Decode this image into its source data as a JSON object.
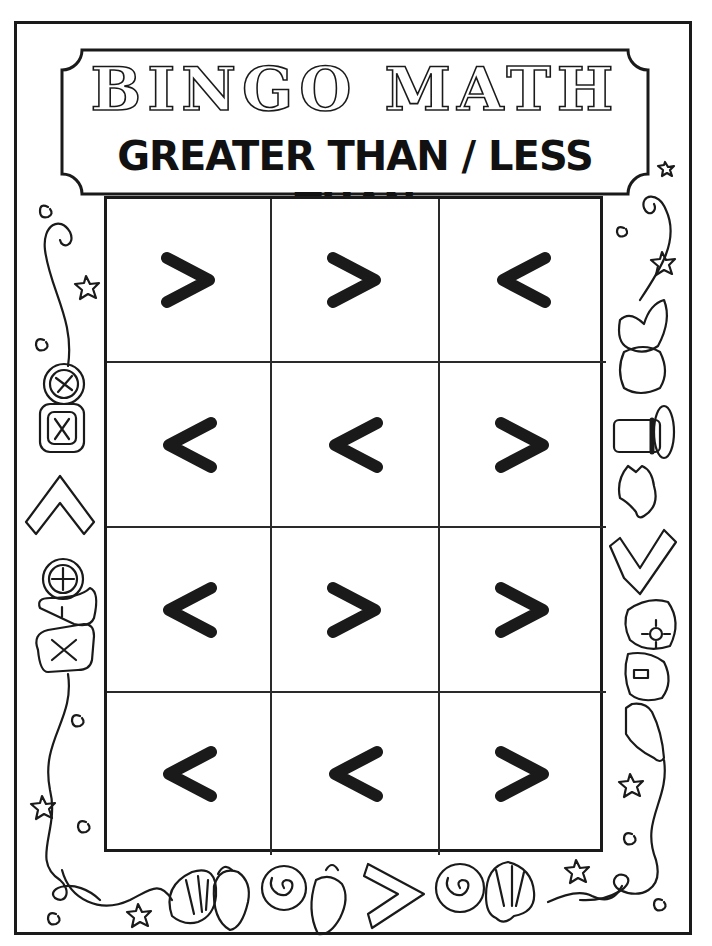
{
  "worksheet": {
    "title": "BINGO MATH",
    "subtitle": "GREATER THAN / LESS THAN"
  },
  "bingo_grid": {
    "columns": 3,
    "rows": 4,
    "cells": [
      [
        ">",
        ">",
        "<"
      ],
      [
        "<",
        "<",
        ">"
      ],
      [
        "<",
        ">",
        ">"
      ],
      [
        "<",
        "<",
        ">"
      ]
    ]
  },
  "decorations": {
    "left_border": [
      "spiral-icon",
      "star-icon",
      "button-plus-icon",
      "button-x-icon",
      "caret-up-icon",
      "button-plus-icon",
      "heart-button-icon",
      "button-x-icon",
      "spiral-icon",
      "star-icon"
    ],
    "right_border": [
      "spiral-icon",
      "star-icon",
      "hat-icon",
      "top-hat-icon",
      "cowboy-hat-icon",
      "less-than-outline-icon",
      "flower-hat-icon",
      "hat-icon",
      "star-icon",
      "spiral-icon"
    ],
    "bottom_border": [
      "spiral-icon",
      "star-icon",
      "scallop-shell-icon",
      "conch-shell-icon",
      "snail-shell-icon",
      "greater-than-outline-icon",
      "snail-shell-icon",
      "scallop-shell-icon",
      "star-icon",
      "spiral-icon"
    ]
  },
  "colors": {
    "ink": "#1a1a1a",
    "paper": "#ffffff"
  }
}
